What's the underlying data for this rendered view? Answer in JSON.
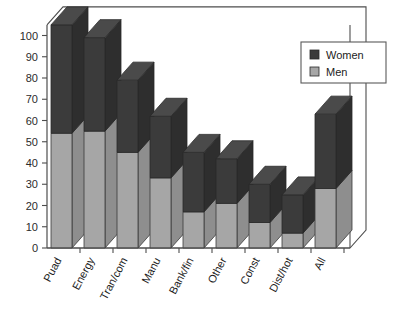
{
  "chart_data": {
    "type": "bar",
    "subtype": "stacked-3d-column",
    "title": "",
    "subtitle": "",
    "xlabel": "",
    "ylabel": "",
    "categories": [
      "Puad",
      "Energy",
      "Tran/com",
      "Manu",
      "Bank/fin",
      "Other",
      "Const",
      "Dist/hot",
      "All"
    ],
    "series": [
      {
        "name": "Men",
        "color": "#a6a6a6",
        "values": [
          54,
          55,
          45,
          33,
          17,
          21,
          12,
          7,
          28
        ]
      },
      {
        "name": "Women",
        "color": "#3b3b3b",
        "values": [
          51,
          44,
          34,
          29,
          28,
          21,
          18,
          18,
          35
        ]
      }
    ],
    "totals": [
      105,
      99,
      79,
      62,
      45,
      42,
      30,
      25,
      63
    ],
    "ylim": [
      0,
      105
    ],
    "yticks": [
      0,
      10,
      20,
      30,
      40,
      50,
      60,
      70,
      80,
      90,
      100
    ],
    "ytick_labels": [
      "0",
      "10",
      "20",
      "30",
      "40",
      "50",
      "60",
      "70",
      "80",
      "90",
      "100"
    ],
    "grid": false,
    "legend_position": "top-right",
    "legend_entries": [
      "Women",
      "Men"
    ],
    "stack_order_bottom_to_top": [
      "Men",
      "Women"
    ]
  },
  "legend": {
    "items": [
      {
        "label": "Women",
        "swatch": "#3b3b3b"
      },
      {
        "label": "Men",
        "swatch": "#a6a6a6"
      }
    ]
  },
  "axes": {
    "y_tick_labels": [
      "100",
      "90",
      "80",
      "70",
      "60",
      "50",
      "40",
      "30",
      "20",
      "10",
      "0"
    ],
    "x_tick_labels": [
      "Puad",
      "Energy",
      "Tran/com",
      "Manu",
      "Bank/fin",
      "Other",
      "Const",
      "Dist/hot",
      "All"
    ]
  },
  "colors": {
    "women": "#3b3b3b",
    "women_side": "#2e2e2e",
    "women_top": "#4a4a4a",
    "men": "#a6a6a6",
    "men_side": "#8e8e8e",
    "men_top": "#b8b8b8",
    "axis": "#4d4d4d",
    "background": "#ffffff",
    "floor": "#ffffff",
    "legend_border": "#5a5a5a"
  }
}
